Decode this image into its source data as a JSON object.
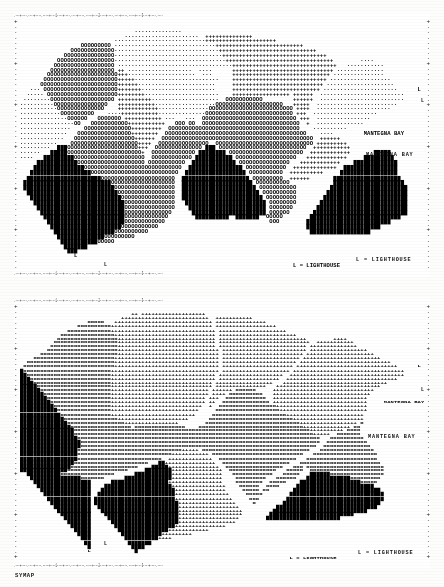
{
  "document": {
    "kind": "computer-printout-map",
    "program_tag": "SYMAP",
    "panels": 2
  },
  "legend": {
    "lighthouse_top": "L = LIGHTHOUSE",
    "lighthouse_bottom": "L = LIGHTHOUSE"
  },
  "labels": {
    "bay_top": "MANTEGNA BAY",
    "bay_bottom": "MANTEGNA BAY",
    "point_marker": "L"
  },
  "panel_top": {
    "name": "upper-choropleth-map",
    "border_top": ".---+----.----+----.----+----1----+----.----+----.----+----2----+----.----+----.----+----3----+----.----+----.----+----4----+----.----+----.----+----5----+----.----+----.----+----6----+----.----+----.----+----7----+----.----+----.----+----8----+----.----+----.----+----9----+----.----+----.",
    "border_bottom": ".---+----.----+----.----+----1----+----.----+----.----+----2----+----.----+----.----+----3----+----.----+----.----+----4----+----.----+----.----+----5----+----.----+----.----+----6----+----.----+----.----+----7----+----.----+----.----+----8----+----.----+----.----+----9----+----.----+----.",
    "border_side": "+.......+.......+.......+.......+.......+.......+.......+.......+",
    "annotations": [
      {
        "text": "MANTEGNA BAY",
        "x": 366,
        "y": 155
      },
      {
        "text": "L = LIGHTHOUSE",
        "x": 356,
        "y": 258
      },
      {
        "text": "L",
        "x": 420,
        "y": 101
      },
      {
        "text": "L",
        "x": 104,
        "y": 264
      }
    ],
    "rows": [
      "                                                                                                                        ",
      "                                                                                                                        ",
      "                                  ..............                                                                        ",
      "                               ......................  ++++++++++++++                                                   ",
      "                            ...........................+++++++++++++++++++++                                            ",
      "                  ccccccccc ..............................++++++++++++++++++++++++++                                    ",
      "               ccccccccccccc...............................+++++++++++++++++++++++++++++                                ",
      "             ccccccccccccccc................................+++++++++++++++++++++++++++++++                             ",
      "           ccccccccccccccccc.................................++++++++++++++++++++++++++++++++        ....               ",
      "          cccccccccccccccccc ..................................+++++++++++++++++++++++++++++++   ...........            ",
      "         ccccccccccccccccccc ++ ...................  ....      ++++++++++++++++++++++++++++++ ..............            ",
      "        ccccccccccccccccccccc+++....................  ...      +++++++++++++++++++++++++++++ ...............            ",
      "       cccccccccccccccccccccc+++++.........................    ++++++++++++++++++++++++++++ ..................          ",
      "      ccccccccccccccccccccccc++++++.......................     +++++++++++++++++++++++++++ ....................         ",
      "   ... cccccccccccccccccccccc+++++++......................     ++++++++++++++++++++++++++ ......................      L ",
      "  ..... ccccccccccccccccccccc++++++++......................    +++++++++++++++++ ++++++  .........................     ",
      " ........ccccccccccccccccccc ++++++++++....................  ccccccccccc         ++++++  .........................     ",
      "..........cccccccccccccccc   +++++++++++..................cccccccccccccccccccc   +++++  ........................      ",
      "...........cccccccccccccc    ++++++++++++...............ccccccccccccccccccccccccc ++++  ......................         ",
      "............cccccccccc    ....+++++++++++..............cccccccccccccccccccccccccc +++  ...................             ",
      "..............cccccc   ccccccc +++++++++++ ...   ...  cccccccccccccccccccccccccccc +++  ................               ",
      "................cc   ccccccccccc+++++++++++   ccc cc  ccccccccccccccccccccccccccccc  +  ..............                 ",
      "...............    cccccccccccccc+++++++++  ccccccccccccccccccccccccccccccccccccccc    ..........                      ",
      "..............   cccccccccccccccc++++++++  cccccccccccccccccccccccccccccccccccccccccc    ....         MANTEGNA BAY     ",
      ".............   cccccccccccccccccc++++++  ccccccccccccccccccccccccccccccccccccccccccccc  ++++++                        ",
      "...........    cccccccccccccccccccc++++  ccccccccccccccc  ccccccccccccccccccccccccccccc +++++++++                      ",
      ".........  ###ccccccccccccccccccccc+++  cccccccccccccc ### cccccccccccccccccccccccccc  +++++++++++                     ",
      "......   #####cccccccccccccccccccccc+  ccccccccccccc ######## cccccccccccccccccccccc  ++++++++++++       #####         ",
      "....   #########ccccccccccccccccccccc  cccccccccccc ########### cccccccccccccccccc   ++++++++++++     #########        ",
      "     ############cccccccccccccccccccc ccccccccccc  ############# ccccccccccccccc   ++++++++++++    #############       ",
      "    ###############ccccccccccccccccccccccccccccc  ################ cccccccccccc  +++++++++++++  ################       ",
      "   ##################cccccccccccccccccccccccccc  ################## cccccccccc  ++++++++++     #################       ",
      "  ######################cccccccccccccccccccccc  #################### ccccccccc  ++++++       ####################      ",
      " ##########################ccccccccccccccccccc  ##################### cccccccccc             #####################     ",
      " ###########################cccccccccccccccccc  ###################### ccccccccccc          #######################    ",
      "  ###########################ccccccccccccccccc  ####################### cccccccccc         ########################    ",
      "   ###########################cccccccccccccccc  ######################## ccccccccc        #########################    ",
      "    ###########################ccccccccccccccc   ######################## cccccccc       ##########################    ",
      "     ##########################ccccccccccccccc    ####################### ccccccc       ###########################    ",
      "      #########################cccccccccccccc      ###################### cccccc       ############################    ",
      "       ########################ccccccccccccc        ##########  #######  ccccc        ###########################      ",
      "        #######################cccccccccccc                               ccc        #########################        ",
      "         #####################ccccccccccc                                            ######################           ",
      "          ##################cccccccccc                                                ##################              ",
      "           ##############ccccccccc                                                                                    ",
      "            ###########ccccc                                                                                          ",
      "             #######                                                                                                  ",
      "              ###                                                                                                     ",
      "                L                                                                                                     ",
      "                                                                                                                      ",
      "                                                                                 L = LIGHTHOUSE                        "
    ]
  },
  "panel_bottom": {
    "name": "lower-choropleth-map",
    "border_top": ".---+----.----+----.----+----1----+----.----+----.----+----2----+----.----+----.----+----3----+----.----+----.----+----4----+----.----+----.----+----5----+----.----+----.----+----6----+----.----+----.----+----7----+----.----+----.----+----8----+----.----+----.----+----9----+----.----+----.",
    "border_bottom": ".---+----.----+----.----+----1----+----.----+----.----+----2----+----.----+----.----+----3----+----.----+----.----+----4----+----.----+----.----+----5----+----.----+----.----+----6----+----.----+----.----+----7----+----.----+----.----+----8----+----.----+----.----+----9----+----.----+----.",
    "border_side": "+.......+.......+.......+.......+.......+.......+.......+.......+",
    "annotations": [
      {
        "text": "MANTEGNA BAY",
        "x": 368,
        "y": 437
      },
      {
        "text": "L = LIGHTHOUSE",
        "x": 358,
        "y": 551
      },
      {
        "text": "L",
        "x": 420,
        "y": 390
      },
      {
        "text": "L",
        "x": 104,
        "y": 543
      }
    ],
    "rows": [
      "                                                                                                                       ",
      "                                                                                                                       ",
      "                                 ++ +++++++++++++++++++                                                                 ",
      "                              ++++++++++++++++++++++++++  +++++++++++                                                   ",
      "                    ccccc   +++++++++++++++++++++++++++++ +++++++++++++++                                               ",
      "                 cccccccccc++++++++++++++++++++++++++++++ ++++++++++++++++++                                            ",
      "              ccccccccccccc+++++++++++++++++++++++++++++++ ++++++++++++++++++++                                         ",
      "            cccccccccccccccc++++++++++++++++++++++++++++++ +++++++++++++++++++++++                                      ",
      "           cccccccccccccccccc+++++++++++++++++++++++++++++ ++++++++++++++++++++++++++        ++++                       ",
      "          ccccccccccccccccccc+++++++++++++++++++++++++++++ +++++++++++++++++++++++++++  +++++++++++                     ",
      "         cccccccccccccccccccc+++++++++++++++++++++++++++++ ++++++++++++++++++++++++++ ++++++++++++++                    ",
      "        ccccccccccccccccccccc++++++++++++++++++++++++++++++ +++++++++++++++++++++++++ +++++++++++++++++                 ",
      "      ccccccccccccccccccccccc++++++++++++++++++++++++++++++ ++++++++++++++++++++++++ ++++++++++++++++++++               ",
      "    cccccccccccccccccccccccc+++++++++++++++++++++++++++++++ +++++++++++++++++++++++ +++++++++++++++++++++++             ",
      "  cccccccccccccccccccccccccc+++++++++++++++++++++++++++++++ ++++++++++++++++++++++ +++++++++++++++++++++++++++          ",
      " ccccccccccccccccccccccccccc+++++++++++++++++++++++++++++++ +++++++++++++++++++++ ++++++++++++++++++++++++++++++      L ",
      "#cccccccccccccccccccccccccc++++++++++++++++++++++++++++++++ ++++++++++++++++++++ +++++++++++++++++++++++++++++++++     ",
      "##ccccccccccccccccccccccccc+++++++++++++++++++++++++++++++ +++++++++++++++++++  ++++++++++++++++++++++++++++++++++     ",
      "###cccccccccccccccccccccccc+++++++++++++++++++++++++++++++ ++++++++++++++++++  +++++++++++++++++++++++++++++++++       ",
      "####ccccccccccccccccccccccc++++++++++++++++++++++++++++++ +++++++++++++++++   +++++++++++++++++++++++++++++++          ",
      "#####cccccccccccccccccccccc++++++++++++++++++++++++++++++ +++++++++++++++   +++++++++++++++++++++++++++++++            ",
      "######ccccccccccccccccccccc+++++++++++++++++++++++++++++ ++++++ cccccc     ++++++++++++++++++++++++++++++              ",
      "#######cccccccccccccccccccc+++++++++++++++++++++++++++++ ++++ cccccccccc   +++++++++++++++++++++++++++++               ",
      "########ccccccccccccccccccc++++++++++++++++++++++++++++ +++  cccccccccccc  ++++++++++++++++++++++++++++                ",
      "#########cccccccccccccccccc++++++++++++++++++++++++++++ ++  cccccccccccccc ++++++++++++++++++++++++++++     MANTEGNA BAY",
      "##########ccccccccccccccccc+++++++++++++++++++++++++++  +  ccccccccccccccccc+++++++++++++++++++++++++++                 ",
      "###########cccccccccccccccc++++++++++++++++++++++++++     ccccccccccccccccccc++++++++++++++++++++++++++                 ",
      "############ccccccccccccccc+++++++++++++++++++++++++     cccccccccccccccccccccc+++++++++++++++++++++++                  ",
      "#############cccccccccccccccc+++++++++++++++++++++      ccccccccccccccccccccccccc+++++++++++++++++++++                  ",
      "##############ccccccccccccccccc++++++++++++++++        cccccccccccccccccccccccccccc+++++++++++++++++ c                  ",
      "###############cccccccccccccccccc ccccccccccccccc    ccccccccccccccccccccccccccccccc++++++++++++++ cc                   ",
      "################cccccccccccccccccccccccccccccccccccccccccccccccccccccccccccccccccccccc++++++++++ cccc                   ",
      "################ccccccccccccccccccccccccccccccccccccccccccccccccccccccccccccccccccccccc+++++  ccccccc                   ",
      "#################cccccccccccccccccccccccccccccccccccccccccccccccccccccccccccccccccccccccc   cccccccccc                  ",
      "##################ccccccccccccccccccccccccccccccccccccccccccccccccccccccccccccccccccccccc  cccccccccccc                 ",
      "##################cccccccccccccccccccccccccccccccccccccccccccccccccccccccccccccccccccccc  cccccccccccccc               ",
      "#################ccccccccccccccccccccccccccccccc+++++ cccccccccccccccccccccccccccccccc   cccccccccccccccc               ",
      "#################cccccccccccccccccccccccccccc+++++++++++ ccccccccccccccccccccccccccc   ccccccccccccccccccc              ",
      "#################ccccccccccccccccccccccccc  +++++++++++++  ccccccccccccccccccccccc   ccccccccccccccccccccc              ",
      "################cccccccccccccccccccccc   ##+++++++++++++++  cccccccccccccccccccc   cccccccccccccccccccccccc             ",
      "###############cccccccccccccccccccc    #####+++++++++++++++  ccccccccccccccccc   ccc ccccccccccccccccccccccc            ",
      "##############cccccccccccccccccc     ########+++++++++++++++  cccccccccccccc   ccccc  cccccccccccccccccccccc            ",
      "  ##########cccccccccccccccc      ###########+++++++++++++++   cccccccccccc   ccccc   ######cccccccccccccccc            ",
      "   ###############ccccccc      ##############+++++++++++++++    ccccccccc   cccccc   #############ccccccccc             ",
      "    #################      #################++++++++++++++++    cccccccc  ccccc    ##################ccccc              ",
      "     ################    ####################++++++++++++++++    cccccc  cccc     #######################               ",
      "      ###############   ######################+++++++++++++++     ccccc cc       ##########################             ",
      "       ##############  #######################++++++++++++++++     ccccc        ############################            ",
      "        ############# ########################+++++++++++++++++     ccc        #############################            ",
      "         ############ #########################+++++++++++++++++     c        #############################             ",
      "          ###########  ########################++++++++++++++++++           ##############################              ",
      "           ##########   #######################+++++++++++++++++++         ############################                 ",
      "            #########    ######################+++++++++++++++++++        #########################                     ",
      "             ########     #####################++++++++++++++++++        ######################                         ",
      "              #######      ####################+++++++++++++++++                                                        ",
      "               ######       ##################+++++++++++++++                                                           ",
      "                #####        ###############++++++++++++                                                                ",
      "                 ####         ############+++++++++                                                                     ",
      "                  ###          ##########++++                                                                           ",
      "                   ##           #######                                                                                 ",
      "                    #            ####                                                                                   ",
      "                    L             #                                                                                     ",
      "                                                                                                                        ",
      "                                                                                L = LIGHTHOUSE                          "
    ]
  }
}
